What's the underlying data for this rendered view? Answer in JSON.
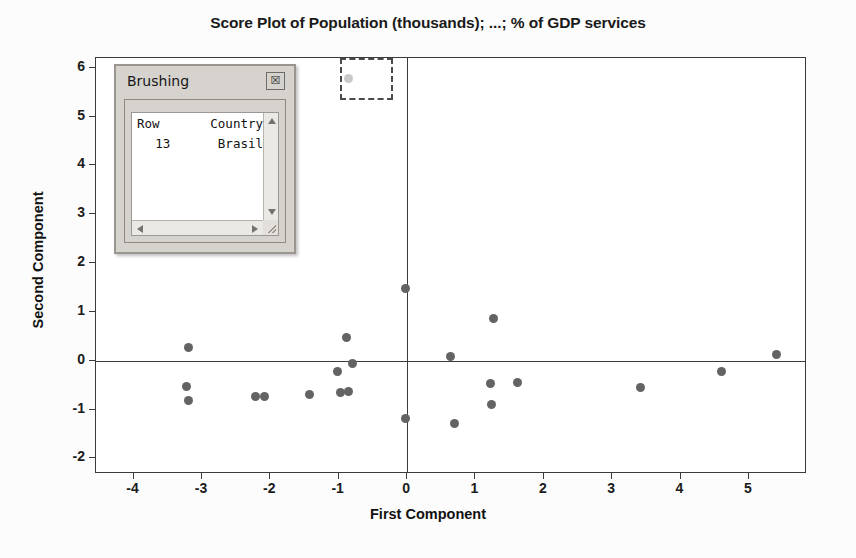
{
  "chart_data": {
    "type": "scatter",
    "title": "Score Plot of Population (thousands); ...; % of GDP services",
    "xlabel": "First Component",
    "ylabel": "Second Component",
    "xlim": [
      -4.55,
      5.85
    ],
    "ylim": [
      -2.32,
      6.2
    ],
    "xticks": [
      -4,
      -3,
      -2,
      -1,
      0,
      1,
      2,
      3,
      4,
      5
    ],
    "xticklabels": [
      "-4",
      "-3",
      "-2",
      "-1",
      "0",
      "1",
      "2",
      "3",
      "4",
      "5"
    ],
    "yticks": [
      -2,
      -1,
      0,
      1,
      2,
      3,
      4,
      5,
      6
    ],
    "yticklabels": [
      "-2",
      "-1",
      "0",
      "1",
      "2",
      "3",
      "4",
      "5",
      "6"
    ],
    "grid": false,
    "legend": null,
    "reference_lines": {
      "x": 0,
      "y": 0
    },
    "marker_color": "#636363",
    "selected_marker_color": "#c9c9c9",
    "points": [
      {
        "x": -3.2,
        "y": 0.28,
        "selected": false
      },
      {
        "x": -3.23,
        "y": -0.52,
        "selected": false
      },
      {
        "x": -3.2,
        "y": -0.81,
        "selected": false
      },
      {
        "x": -2.22,
        "y": -0.73,
        "selected": false
      },
      {
        "x": -2.08,
        "y": -0.73,
        "selected": false
      },
      {
        "x": -1.43,
        "y": -0.7,
        "selected": false
      },
      {
        "x": -1.02,
        "y": -0.22,
        "selected": false
      },
      {
        "x": -0.97,
        "y": -0.65,
        "selected": false
      },
      {
        "x": -0.86,
        "y": -0.64,
        "selected": false
      },
      {
        "x": -0.88,
        "y": 0.48,
        "selected": false
      },
      {
        "x": -0.8,
        "y": -0.05,
        "selected": false
      },
      {
        "x": -0.85,
        "y": 5.78,
        "selected": true
      },
      {
        "x": -0.02,
        "y": 1.47,
        "selected": false
      },
      {
        "x": -0.03,
        "y": -1.18,
        "selected": false
      },
      {
        "x": 0.64,
        "y": 0.09,
        "selected": false
      },
      {
        "x": 0.7,
        "y": -1.28,
        "selected": false
      },
      {
        "x": 1.22,
        "y": -0.46,
        "selected": false
      },
      {
        "x": 1.27,
        "y": 0.86,
        "selected": false
      },
      {
        "x": 1.24,
        "y": -0.9,
        "selected": false
      },
      {
        "x": 1.62,
        "y": -0.44,
        "selected": false
      },
      {
        "x": 3.41,
        "y": -0.54,
        "selected": false
      },
      {
        "x": 4.6,
        "y": -0.22,
        "selected": false
      },
      {
        "x": 5.4,
        "y": 0.13,
        "selected": false
      }
    ],
    "selection_marquee": {
      "x0": -0.98,
      "x1": -0.2,
      "y0": 5.34,
      "y1": 6.2
    }
  },
  "brushing": {
    "title": "Brushing",
    "close_icon": "close-icon",
    "columns": [
      "Row",
      "Country"
    ],
    "rows": [
      {
        "row": "13",
        "country": "Brasil"
      }
    ],
    "scrollbars": {
      "up_icon": "chevron-up-icon",
      "down_icon": "chevron-down-icon",
      "left_icon": "chevron-left-icon",
      "right_icon": "chevron-right-icon",
      "resize_icon": "resize-grip-icon"
    }
  }
}
